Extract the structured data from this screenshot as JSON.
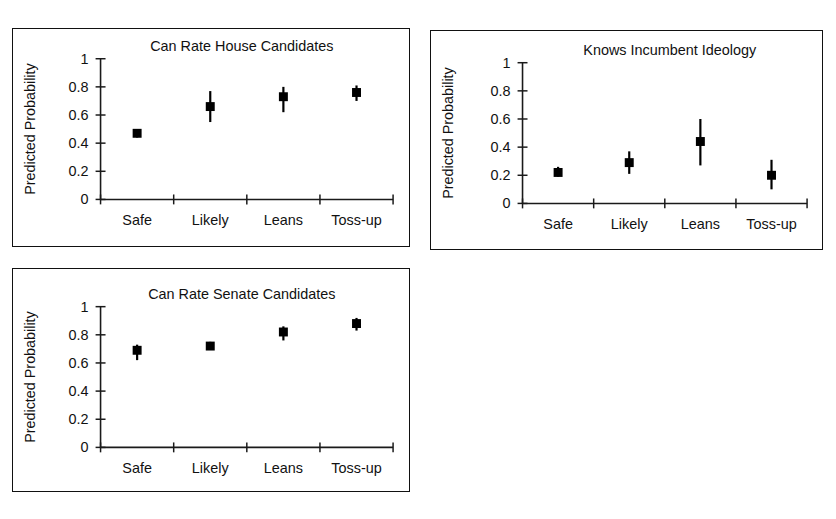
{
  "figure": {
    "background": "#ffffff",
    "ink_color": "#111111",
    "marker_color": "#000000"
  },
  "chart_data": [
    {
      "type": "scatter",
      "panel": "top-left",
      "title": "Can Rate House Candidates",
      "xlabel": "",
      "ylabel": "Predicted Probability",
      "categories": [
        "Safe",
        "Likely",
        "Leans",
        "Toss-up"
      ],
      "values": [
        0.47,
        0.66,
        0.73,
        0.76
      ],
      "error_low": [
        0.44,
        0.55,
        0.62,
        0.7
      ],
      "error_high": [
        0.5,
        0.77,
        0.8,
        0.81
      ],
      "ylim": [
        0,
        1
      ],
      "yticks": [
        0,
        0.2,
        0.4,
        0.6,
        0.8,
        1
      ],
      "ytick_labels": [
        "0",
        "0.2",
        "0.4",
        "0.6",
        "0.8",
        "1"
      ],
      "grid": false,
      "legend": "none",
      "marker": "filled-square",
      "errorbar_style": "plain-vertical-line"
    },
    {
      "type": "scatter",
      "panel": "top-right",
      "title": "Knows Incumbent Ideology",
      "xlabel": "",
      "ylabel": "Predicted Probability",
      "categories": [
        "Safe",
        "Likely",
        "Leans",
        "Toss-up"
      ],
      "values": [
        0.22,
        0.29,
        0.44,
        0.2
      ],
      "error_low": [
        0.19,
        0.21,
        0.27,
        0.1
      ],
      "error_high": [
        0.26,
        0.37,
        0.6,
        0.31
      ],
      "ylim": [
        0,
        1
      ],
      "yticks": [
        0,
        0.2,
        0.4,
        0.6,
        0.8,
        1
      ],
      "ytick_labels": [
        "0",
        "0.2",
        "0.4",
        "0.6",
        "0.8",
        "1"
      ],
      "grid": false,
      "legend": "none",
      "marker": "filled-square",
      "errorbar_style": "plain-vertical-line"
    },
    {
      "type": "scatter",
      "panel": "bottom-left",
      "title": "Can Rate Senate Candidates",
      "xlabel": "",
      "ylabel": "Predicted Probability",
      "categories": [
        "Safe",
        "Likely",
        "Leans",
        "Toss-up"
      ],
      "values": [
        0.69,
        0.72,
        0.82,
        0.88
      ],
      "error_low": [
        0.62,
        0.7,
        0.76,
        0.83
      ],
      "error_high": [
        0.73,
        0.75,
        0.86,
        0.92
      ],
      "ylim": [
        0,
        1
      ],
      "yticks": [
        0,
        0.2,
        0.4,
        0.6,
        0.8,
        1
      ],
      "ytick_labels": [
        "0",
        "0.2",
        "0.4",
        "0.6",
        "0.8",
        "1"
      ],
      "grid": false,
      "legend": "none",
      "marker": "filled-square",
      "errorbar_style": "plain-vertical-line"
    }
  ]
}
